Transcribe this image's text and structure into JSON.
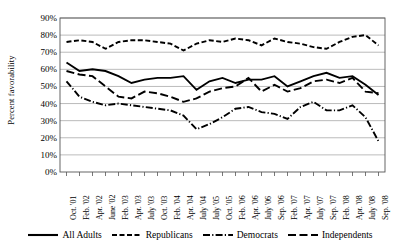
{
  "chart_data": {
    "type": "line",
    "title": "",
    "xlabel": "",
    "ylabel": "Percent favorability",
    "ylim": [
      0,
      90
    ],
    "ytick_values": [
      0,
      10,
      20,
      30,
      40,
      50,
      60,
      70,
      80,
      90
    ],
    "ytick_labels": [
      "0%",
      "10%",
      "20%",
      "30%",
      "40%",
      "50%",
      "60%",
      "70%",
      "80%",
      "90%"
    ],
    "grid": "horizontal",
    "legend_position": "bottom",
    "categories": [
      "Oct. '01",
      "Feb. '02",
      "Apr. '02",
      "June '02",
      "Feb. '03",
      "Apr. '03",
      "July '03",
      "Oct. '03",
      "Feb. '04",
      "Apr. '04",
      "July '04",
      "July '05",
      "Oct. '05",
      "Feb. '06",
      "Apr. '06",
      "July '06",
      "Sep. '06",
      "Feb. '07",
      "Apr. '07",
      "July '07",
      "Sep. '07",
      "Feb. '08",
      "Apr. '08",
      "July '08",
      "Sep. '08"
    ],
    "series": [
      {
        "name": "All Adults",
        "style": "solid",
        "values": [
          64,
          59,
          60,
          59,
          56,
          52,
          54,
          55,
          55,
          56,
          48,
          53,
          55,
          52,
          54,
          54,
          56,
          50,
          53,
          56,
          58,
          55,
          56,
          51,
          45
        ]
      },
      {
        "name": "Republicans",
        "style": "dashed",
        "values": [
          76,
          77,
          76,
          72,
          76,
          77,
          77,
          76,
          75,
          71,
          75,
          77,
          76,
          78,
          77,
          74,
          78,
          76,
          75,
          73,
          72,
          76,
          79,
          80,
          74
        ]
      },
      {
        "name": "Democrats",
        "style": "dash-dot",
        "values": [
          53,
          44,
          41,
          39,
          40,
          39,
          38,
          37,
          36,
          33,
          25,
          28,
          32,
          37,
          38,
          35,
          34,
          31,
          38,
          41,
          36,
          36,
          39,
          32,
          18
        ]
      },
      {
        "name": "Independents",
        "style": "long-dash",
        "values": [
          59,
          57,
          56,
          50,
          44,
          43,
          47,
          46,
          44,
          41,
          43,
          47,
          49,
          50,
          55,
          47,
          51,
          47,
          49,
          53,
          54,
          52,
          55,
          47,
          46
        ]
      }
    ]
  },
  "legend": {
    "items": [
      {
        "label": "All Adults",
        "style": "solid"
      },
      {
        "label": "Republicans",
        "style": "dashed"
      },
      {
        "label": "Democrats",
        "style": "dash-dot"
      },
      {
        "label": "Independents",
        "style": "long-dash"
      }
    ]
  }
}
